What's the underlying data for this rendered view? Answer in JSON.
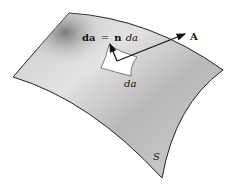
{
  "diagram": {
    "surface_label": "S",
    "vector_label": "A",
    "area_element_label": "da",
    "equation": {
      "lhs": "da",
      "equals": "=",
      "rhs_bold": "n",
      "rhs_ital": "da"
    },
    "colors": {
      "surface_fill": "#d6d6d6",
      "surface_shade": "#9a9a9a",
      "outline": "#222222",
      "patch_fill": "#ffffff"
    }
  }
}
